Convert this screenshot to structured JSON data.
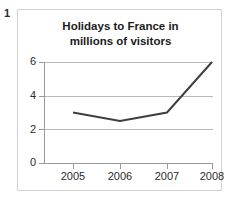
{
  "figure": {
    "number_label": "1"
  },
  "chart_data": {
    "type": "line",
    "title": "Holidays to France in millions of visitors",
    "title_lines": [
      "Holidays to France in",
      "millions of visitors"
    ],
    "xlabel": "",
    "ylabel": "",
    "categories": [
      "2005",
      "2006",
      "2007",
      "2008"
    ],
    "values": [
      3.0,
      2.5,
      3.0,
      6.0
    ],
    "series": [
      {
        "name": "Holidays to France",
        "values": [
          3.0,
          2.5,
          3.0,
          6.0
        ],
        "color": "#3f3f3f"
      }
    ],
    "ylim": [
      0,
      6
    ],
    "ytick_labels": [
      "0",
      "2",
      "4",
      "6"
    ],
    "ytick_values": [
      0,
      2,
      4,
      6
    ],
    "xtick_labels": [
      "2005",
      "2006",
      "2007",
      "2008"
    ],
    "grid": true,
    "grid_axis": "y",
    "grid_color": "#b9b9b9",
    "legend": false,
    "legend_position": "none",
    "markers": false,
    "line_width_px": 2,
    "axis_color": "#9a9a9a",
    "background_color": "#ffffff",
    "border_color": "#d2d2d2"
  }
}
